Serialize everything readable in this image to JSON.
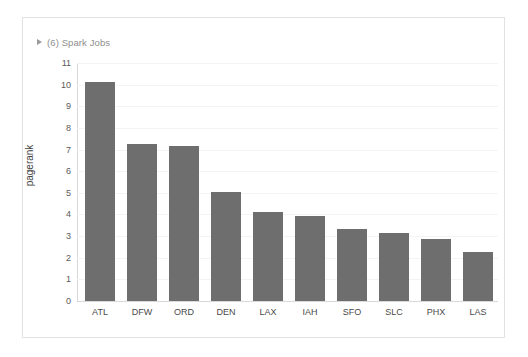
{
  "card": {
    "header": {
      "label": "(6) Spark Jobs",
      "disclosure_icon": "triangle-right-icon",
      "expanded": false
    }
  },
  "colors": {
    "bar_fill": "#6e6e6e",
    "gridline": "#f4f4f4",
    "axis_line": "#d8d8d8",
    "card_border": "#e2e2e2",
    "header_text": "#8e8e8e",
    "tick_text": "#5a5a5a",
    "background": "#ffffff"
  },
  "chart_data": {
    "type": "bar",
    "title": "",
    "xlabel": "",
    "ylabel": "pagerank",
    "ylim": [
      0,
      11
    ],
    "yticks": [
      0,
      1,
      2,
      3,
      4,
      5,
      6,
      7,
      8,
      9,
      10,
      11
    ],
    "grid": true,
    "legend": "none",
    "categories": [
      "ATL",
      "DFW",
      "ORD",
      "DEN",
      "LAX",
      "IAH",
      "SFO",
      "SLC",
      "PHX",
      "LAS"
    ],
    "values": [
      10.1,
      7.25,
      7.15,
      5.05,
      4.1,
      3.95,
      3.35,
      3.15,
      2.85,
      2.25
    ]
  }
}
